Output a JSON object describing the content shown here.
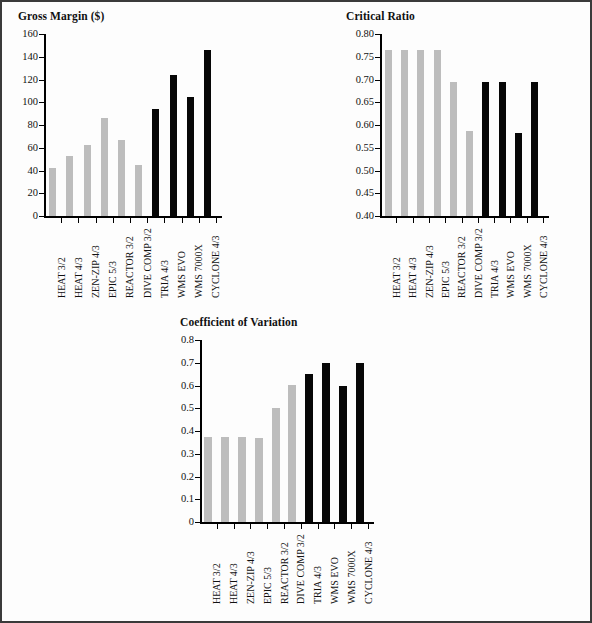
{
  "page": {
    "background": "#fdfdfd",
    "border_color": "#3a3a3a"
  },
  "colors": {
    "gray_bar": "#bdbdbd",
    "black_bar": "#070707",
    "axis": "#000000",
    "text": "#111111"
  },
  "charts": [
    {
      "id": "gross-margin",
      "title": "Gross Margin ($)",
      "type": "bar",
      "xlabel": "",
      "ylabel": "",
      "ylim": [
        0,
        160
      ],
      "ytick_step": 20,
      "ytick_labels": [
        "0",
        "20",
        "40",
        "60",
        "80",
        "100",
        "120",
        "140",
        "160"
      ],
      "grid": false,
      "legend": "none",
      "categories": [
        "HEAT 3/2",
        "HEAT 4/3",
        "ZEN-ZIP 4/3",
        "EPIC 5/3",
        "REACTOR 3/2",
        "DIVE COMP 3/2",
        "TRIA 4/3",
        "WMS EVO",
        "WMS 7000X",
        "CYCLONE 4/3"
      ],
      "values": [
        42,
        53,
        62,
        86,
        67,
        45,
        94,
        124,
        105,
        146
      ],
      "bar_colors": [
        "gray",
        "gray",
        "gray",
        "gray",
        "gray",
        "gray",
        "black",
        "black",
        "black",
        "black"
      ]
    },
    {
      "id": "critical-ratio",
      "title": "Critical Ratio",
      "type": "bar",
      "xlabel": "",
      "ylabel": "",
      "ylim": [
        0.4,
        0.8
      ],
      "ytick_step": 0.05,
      "ytick_labels": [
        "0.40",
        "0.45",
        "0.50",
        "0.55",
        "0.60",
        "0.65",
        "0.70",
        "0.75",
        "0.80"
      ],
      "grid": false,
      "legend": "none",
      "categories": [
        "HEAT 3/2",
        "HEAT 4/3",
        "ZEN-ZIP 4/3",
        "EPIC 5/3",
        "REACTOR 3/2",
        "DIVE COMP 3/2",
        "TRIA 4/3",
        "WMS EVO",
        "WMS 7000X",
        "CYCLONE 4/3"
      ],
      "values": [
        0.765,
        0.765,
        0.765,
        0.765,
        0.695,
        0.587,
        0.695,
        0.695,
        0.583,
        0.694
      ],
      "bar_colors": [
        "gray",
        "gray",
        "gray",
        "gray",
        "gray",
        "gray",
        "black",
        "black",
        "black",
        "black"
      ]
    },
    {
      "id": "coefficient-of-variation",
      "title": "Coefficient of Variation",
      "type": "bar",
      "xlabel": "",
      "ylabel": "",
      "ylim": [
        0,
        0.8
      ],
      "ytick_step": 0.1,
      "ytick_labels": [
        "0",
        "0.1",
        "0.2",
        "0.3",
        "0.4",
        "0.5",
        "0.6",
        "0.7",
        "0.8"
      ],
      "grid": false,
      "legend": "none",
      "categories": [
        "HEAT 3/2",
        "HEAT 4/3",
        "ZEN-ZIP 4/3",
        "EPIC 5/3",
        "REACTOR 3/2",
        "DIVE COMP 3/2",
        "TRIA 4/3",
        "WMS EVO",
        "WMS 7000X",
        "CYCLONE 4/3"
      ],
      "values": [
        0.373,
        0.373,
        0.372,
        0.371,
        0.501,
        0.603,
        0.649,
        0.697,
        0.596,
        0.698
      ],
      "bar_colors": [
        "gray",
        "gray",
        "gray",
        "gray",
        "gray",
        "gray",
        "black",
        "black",
        "black",
        "black"
      ]
    }
  ],
  "chart_data": [
    {
      "type": "bar",
      "title": "Gross Margin ($)",
      "xlabel": "",
      "ylabel": "Gross Margin ($)",
      "ylim": [
        0,
        160
      ],
      "grid": false,
      "legend": "none",
      "categories": [
        "HEAT 3/2",
        "HEAT 4/3",
        "ZEN-ZIP 4/3",
        "EPIC 5/3",
        "REACTOR 3/2",
        "DIVE COMP 3/2",
        "TRIA 4/3",
        "WMS EVO",
        "WMS 7000X",
        "CYCLONE 4/3"
      ],
      "values": [
        42,
        53,
        62,
        86,
        67,
        45,
        94,
        124,
        105,
        146
      ],
      "tick_labels_y": [
        "0",
        "20",
        "40",
        "60",
        "80",
        "100",
        "120",
        "140",
        "160"
      ]
    },
    {
      "type": "bar",
      "title": "Critical Ratio",
      "xlabel": "",
      "ylabel": "Critical Ratio",
      "ylim": [
        0.4,
        0.8
      ],
      "grid": false,
      "legend": "none",
      "categories": [
        "HEAT 3/2",
        "HEAT 4/3",
        "ZEN-ZIP 4/3",
        "EPIC 5/3",
        "REACTOR 3/2",
        "DIVE COMP 3/2",
        "TRIA 4/3",
        "WMS EVO",
        "WMS 7000X",
        "CYCLONE 4/3"
      ],
      "values": [
        0.765,
        0.765,
        0.765,
        0.765,
        0.695,
        0.587,
        0.695,
        0.695,
        0.583,
        0.694
      ],
      "tick_labels_y": [
        "0.40",
        "0.45",
        "0.50",
        "0.55",
        "0.60",
        "0.65",
        "0.70",
        "0.75",
        "0.80"
      ]
    },
    {
      "type": "bar",
      "title": "Coefficient of Variation",
      "xlabel": "",
      "ylabel": "Coefficient of Variation",
      "ylim": [
        0,
        0.8
      ],
      "grid": false,
      "legend": "none",
      "categories": [
        "HEAT 3/2",
        "HEAT 4/3",
        "ZEN-ZIP 4/3",
        "EPIC 5/3",
        "REACTOR 3/2",
        "DIVE COMP 3/2",
        "TRIA 4/3",
        "WMS EVO",
        "WMS 7000X",
        "CYCLONE 4/3"
      ],
      "values": [
        0.373,
        0.373,
        0.372,
        0.371,
        0.501,
        0.603,
        0.649,
        0.697,
        0.596,
        0.698
      ],
      "tick_labels_y": [
        "0",
        "0.1",
        "0.2",
        "0.3",
        "0.4",
        "0.5",
        "0.6",
        "0.7",
        "0.8"
      ]
    }
  ]
}
